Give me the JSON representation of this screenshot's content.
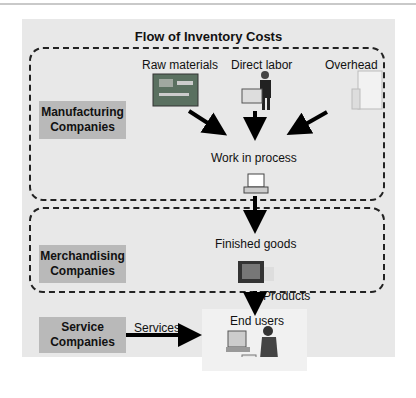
{
  "title": "Flow of Inventory Costs",
  "companies": {
    "manufacturing": [
      "Manufacturing",
      "Companies"
    ],
    "merchandising": [
      "Merchandising",
      "Companies"
    ],
    "service": [
      "Service",
      "Companies"
    ]
  },
  "inputs": {
    "raw_materials": "Raw materials",
    "direct_labor": "Direct labor",
    "overhead": "Overhead"
  },
  "stages": {
    "work_in_process": "Work in process",
    "finished_goods": "Finished goods",
    "end_users": "End users"
  },
  "flows": {
    "products": "Products",
    "services": "Services"
  },
  "icons": [
    "circuit-board-icon",
    "worker-icon",
    "office-building-icon",
    "computer-icon",
    "monitor-icon",
    "person-at-computer-icon"
  ]
}
